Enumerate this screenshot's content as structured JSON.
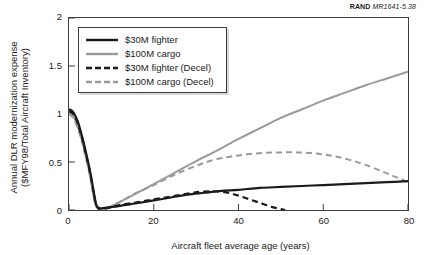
{
  "source_credit": {
    "brand": "RAND",
    "figure_ref": "MR1641-5.38"
  },
  "colors": {
    "fighter": "#1a1a1a",
    "cargo": "#9a9a9a",
    "axis": "#3d3d3d",
    "background": "#ffffff"
  },
  "chart_data": {
    "type": "line",
    "title": "",
    "xlabel": "Aircraft fleet average age (years)",
    "ylabel_line1": "Annual DLR modernization expense",
    "ylabel_line2": "($MFY98/Total Aircraft Inventory)",
    "xlim": [
      0,
      80
    ],
    "ylim": [
      0,
      2
    ],
    "xticks": [
      0,
      20,
      40,
      60,
      80
    ],
    "yticks": [
      0,
      0.5,
      1,
      1.5,
      2
    ],
    "xtick_labels": [
      "0",
      "20",
      "40",
      "60",
      "80"
    ],
    "ytick_labels": [
      "0",
      "0.5",
      "1",
      "1.5",
      "2"
    ],
    "grid": false,
    "legend_position": "upper-left",
    "series": [
      {
        "name": "$30M fighter",
        "color": "#1a1a1a",
        "style": "solid",
        "width": 2.2,
        "points": [
          [
            0.0,
            1.05
          ],
          [
            1.0,
            1.02
          ],
          [
            2.0,
            0.93
          ],
          [
            3.0,
            0.78
          ],
          [
            4.0,
            0.6
          ],
          [
            5.0,
            0.4
          ],
          [
            5.8,
            0.2
          ],
          [
            6.4,
            0.06
          ],
          [
            7.0,
            0.02
          ],
          [
            8.0,
            0.02
          ],
          [
            10.0,
            0.03
          ],
          [
            13.0,
            0.05
          ],
          [
            16.0,
            0.07
          ],
          [
            20.0,
            0.1
          ],
          [
            24.0,
            0.13
          ],
          [
            28.0,
            0.16
          ],
          [
            32.0,
            0.18
          ],
          [
            36.0,
            0.2
          ],
          [
            40.0,
            0.21
          ],
          [
            45.0,
            0.23
          ],
          [
            50.0,
            0.24
          ],
          [
            55.0,
            0.25
          ],
          [
            60.0,
            0.26
          ],
          [
            65.0,
            0.27
          ],
          [
            70.0,
            0.28
          ],
          [
            75.0,
            0.29
          ],
          [
            80.0,
            0.3
          ]
        ]
      },
      {
        "name": "$100M cargo",
        "color": "#9a9a9a",
        "style": "solid",
        "width": 2.0,
        "points": [
          [
            0.0,
            1.02
          ],
          [
            1.0,
            0.98
          ],
          [
            2.0,
            0.88
          ],
          [
            3.0,
            0.74
          ],
          [
            4.0,
            0.56
          ],
          [
            5.0,
            0.36
          ],
          [
            5.8,
            0.16
          ],
          [
            6.5,
            0.03
          ],
          [
            7.5,
            0.01
          ],
          [
            9.0,
            0.02
          ],
          [
            11.0,
            0.06
          ],
          [
            14.0,
            0.13
          ],
          [
            17.0,
            0.2
          ],
          [
            20.0,
            0.27
          ],
          [
            25.0,
            0.39
          ],
          [
            30.0,
            0.51
          ],
          [
            35.0,
            0.62
          ],
          [
            40.0,
            0.74
          ],
          [
            45.0,
            0.85
          ],
          [
            50.0,
            0.96
          ],
          [
            55.0,
            1.05
          ],
          [
            60.0,
            1.14
          ],
          [
            65.0,
            1.22
          ],
          [
            70.0,
            1.3
          ],
          [
            75.0,
            1.37
          ],
          [
            80.0,
            1.44
          ]
        ]
      },
      {
        "name": "$30M fighter (Decel)",
        "color": "#1a1a1a",
        "style": "dashed",
        "width": 2.2,
        "points": [
          [
            0.0,
            1.03
          ],
          [
            1.0,
            1.0
          ],
          [
            2.0,
            0.91
          ],
          [
            3.0,
            0.76
          ],
          [
            4.0,
            0.58
          ],
          [
            5.0,
            0.38
          ],
          [
            5.8,
            0.18
          ],
          [
            6.5,
            0.04
          ],
          [
            7.5,
            0.01
          ],
          [
            9.0,
            0.02
          ],
          [
            12.0,
            0.05
          ],
          [
            16.0,
            0.08
          ],
          [
            20.0,
            0.11
          ],
          [
            24.0,
            0.14
          ],
          [
            28.0,
            0.17
          ],
          [
            31.0,
            0.19
          ],
          [
            34.0,
            0.195
          ],
          [
            36.0,
            0.19
          ],
          [
            38.0,
            0.175
          ],
          [
            40.0,
            0.15
          ],
          [
            42.0,
            0.12
          ],
          [
            44.0,
            0.09
          ],
          [
            46.0,
            0.06
          ],
          [
            48.0,
            0.03
          ],
          [
            50.0,
            0.01
          ],
          [
            51.0,
            0.0
          ]
        ]
      },
      {
        "name": "$100M cargo (Decel)",
        "color": "#9a9a9a",
        "style": "dashed",
        "width": 2.0,
        "points": [
          [
            0.0,
            1.0
          ],
          [
            1.0,
            0.96
          ],
          [
            2.0,
            0.86
          ],
          [
            3.0,
            0.72
          ],
          [
            4.0,
            0.54
          ],
          [
            5.0,
            0.34
          ],
          [
            5.8,
            0.14
          ],
          [
            6.6,
            0.02
          ],
          [
            8.0,
            0.01
          ],
          [
            10.0,
            0.04
          ],
          [
            13.0,
            0.11
          ],
          [
            16.0,
            0.18
          ],
          [
            20.0,
            0.26
          ],
          [
            25.0,
            0.37
          ],
          [
            30.0,
            0.46
          ],
          [
            34.0,
            0.52
          ],
          [
            38.0,
            0.555
          ],
          [
            42.0,
            0.58
          ],
          [
            46.0,
            0.595
          ],
          [
            50.0,
            0.6
          ],
          [
            54.0,
            0.6
          ],
          [
            58.0,
            0.59
          ],
          [
            62.0,
            0.565
          ],
          [
            66.0,
            0.525
          ],
          [
            70.0,
            0.47
          ],
          [
            74.0,
            0.4
          ],
          [
            77.0,
            0.345
          ],
          [
            80.0,
            0.29
          ]
        ]
      }
    ],
    "legend_entries": [
      {
        "label": "$30M fighter",
        "color": "#1a1a1a",
        "style": "solid"
      },
      {
        "label": "$100M cargo",
        "color": "#9a9a9a",
        "style": "solid"
      },
      {
        "label": "$30M fighter (Decel)",
        "color": "#1a1a1a",
        "style": "dashed"
      },
      {
        "label": "$100M cargo (Decel)",
        "color": "#9a9a9a",
        "style": "dashed"
      }
    ]
  }
}
